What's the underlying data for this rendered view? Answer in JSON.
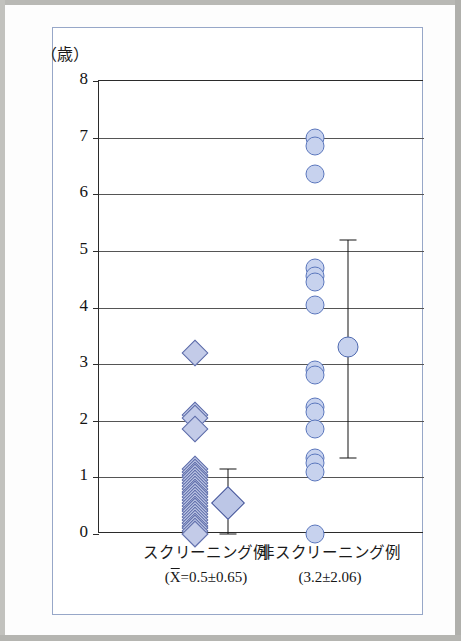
{
  "figure": {
    "unit_label": "（歳）",
    "border_color": "#97a7c8",
    "marker_fill": "#c5cfec",
    "marker_diamond_stroke": "#5b6aa8",
    "marker_circle_stroke": "#5b77bd",
    "errorbar_color": "#141414"
  },
  "axis": {
    "y_ticks": [
      "0",
      "1",
      "2",
      "3",
      "4",
      "5",
      "6",
      "7",
      "8"
    ]
  },
  "categories": {
    "left": {
      "name": "スクリーニング例",
      "stat_prefix": "(",
      "stat_xbar": "X",
      "stat_body": "=0.5±0.65)"
    },
    "right": {
      "name": "非スクリーニング例",
      "stat_text": "(3.2±2.06)"
    }
  },
  "chart_data": {
    "type": "scatter",
    "title": "",
    "xlabel": "",
    "ylabel": "（歳）",
    "ylim": [
      0,
      8
    ],
    "y_ticks": [
      0,
      1,
      2,
      3,
      4,
      5,
      6,
      7,
      8
    ],
    "grid": true,
    "legend": "none",
    "series": [
      {
        "name": "スクリーニング例",
        "marker": "diamond",
        "mean": 0.5,
        "sd": 0.65,
        "mean_label": "(X̄=0.5±0.65)",
        "errorbar": {
          "low": 0.0,
          "high": 1.15,
          "mean_marker_y": 0.55
        },
        "values": [
          3.2,
          2.1,
          2.05,
          1.85,
          1.15,
          1.1,
          1.05,
          1.0,
          0.95,
          0.9,
          0.85,
          0.8,
          0.75,
          0.7,
          0.65,
          0.6,
          0.55,
          0.5,
          0.45,
          0.4,
          0.35,
          0.3,
          0.25,
          0.2,
          0.15,
          0.1,
          0.05,
          0.0,
          0.0
        ]
      },
      {
        "name": "非スクリーニング例",
        "marker": "circle",
        "mean": 3.2,
        "sd": 2.06,
        "mean_label": "(3.2±2.06)",
        "errorbar": {
          "low": 1.35,
          "high": 5.2,
          "mean_marker_y": 3.3
        },
        "values": [
          7.0,
          6.85,
          6.35,
          4.7,
          4.55,
          4.45,
          4.05,
          2.9,
          2.8,
          2.25,
          2.15,
          1.85,
          1.35,
          1.25,
          1.1,
          0.0
        ]
      }
    ]
  }
}
